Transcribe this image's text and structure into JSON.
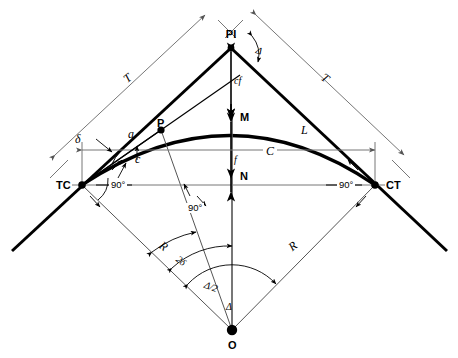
{
  "figure": {
    "type": "horizontal-circular-curve-geometry-diagram",
    "background_color": "#ffffff",
    "line_color": "#000000",
    "thin_line_color": "#7a7a7a"
  },
  "points": [
    {
      "id": "PI",
      "label": "PI",
      "x": 231,
      "y": 40,
      "style": "sans-b",
      "desc": "point-of-intersection"
    },
    {
      "id": "TC",
      "label": "TC",
      "x": 56,
      "y": 180,
      "style": "sans-b",
      "desc": "tangent-to-curve"
    },
    {
      "id": "CT",
      "label": "CT",
      "x": 386,
      "y": 180,
      "style": "sans-b",
      "desc": "curve-to-tangent"
    },
    {
      "id": "P",
      "label": "P",
      "x": 157,
      "y": 118,
      "style": "sans-b",
      "desc": "point-on-curve"
    },
    {
      "id": "O",
      "label": "O",
      "x": 228,
      "y": 340,
      "style": "sans-b",
      "desc": "center-of-curve"
    },
    {
      "id": "M",
      "label": "M",
      "x": 240,
      "y": 112,
      "style": "sans-b",
      "desc": "middle-ordinate-point"
    },
    {
      "id": "N",
      "label": "N",
      "x": 240,
      "y": 171,
      "style": "sans-b",
      "desc": "chord-midpoint-marker"
    }
  ],
  "dimensions": [
    {
      "id": "T-left",
      "label": "T",
      "x": 124,
      "y": 72,
      "style": "serif-i",
      "rot": -38,
      "desc": "tangent-distance-left"
    },
    {
      "id": "T-right",
      "label": "T",
      "x": 322,
      "y": 72,
      "style": "serif-i",
      "rot": 38,
      "desc": "tangent-distance-right"
    },
    {
      "id": "cf",
      "label": "cf",
      "x": 234,
      "y": 76,
      "style": "serif-i-s",
      "rot": 0,
      "desc": "external-distance"
    },
    {
      "id": "L",
      "label": "L",
      "x": 301,
      "y": 124,
      "style": "serif-i",
      "rot": 0,
      "desc": "length-of-curve"
    },
    {
      "id": "C",
      "label": "C",
      "x": 263,
      "y": 145,
      "style": "serif-i",
      "rot": 0,
      "desc": "long-chord"
    },
    {
      "id": "f",
      "label": "f",
      "x": 234,
      "y": 155,
      "style": "serif-i-s",
      "rot": 0,
      "desc": "middle-ordinate"
    },
    {
      "id": "a",
      "label": "a",
      "x": 128,
      "y": 128,
      "style": "serif-i",
      "rot": 0,
      "desc": "arc-length-partial"
    },
    {
      "id": "c",
      "label": "c",
      "x": 135,
      "y": 153,
      "style": "serif-i",
      "rot": 0,
      "desc": "chord-partial"
    },
    {
      "id": "delta",
      "label": "δ",
      "x": 75,
      "y": 133,
      "style": "serif-i",
      "rot": 0,
      "desc": "deflection-angle"
    },
    {
      "id": "R-left",
      "label": "R",
      "x": 160,
      "y": 240,
      "style": "serif-i",
      "rot": 38,
      "desc": "radius-left"
    },
    {
      "id": "R-right",
      "label": "R",
      "x": 289,
      "y": 240,
      "style": "serif-i",
      "rot": -38,
      "desc": "radius-right"
    },
    {
      "id": "twodelta",
      "label": "2δ",
      "x": 176,
      "y": 256,
      "style": "serif-i-s",
      "rot": 38,
      "desc": "two-delta-angle"
    },
    {
      "id": "delta-half",
      "label": "Δ/2",
      "x": 204,
      "y": 282,
      "style": "serif-i-s",
      "rot": 20,
      "desc": "half-central-angle"
    },
    {
      "id": "Delta-O",
      "label": "Δ",
      "x": 226,
      "y": 302,
      "style": "serif-i-s",
      "rot": 0,
      "desc": "central-angle-at-center"
    },
    {
      "id": "Delta-PI",
      "label": "Δ",
      "x": 256,
      "y": 46,
      "style": "serif-i-s",
      "rot": 20,
      "desc": "intersection-angle-at-PI"
    }
  ],
  "angle_marks": [
    {
      "id": "ninety-left",
      "label": "90°",
      "x": 109,
      "y": 180,
      "desc": "right-angle-at-TC"
    },
    {
      "id": "ninety-right",
      "label": "90°",
      "x": 337,
      "y": 180,
      "desc": "right-angle-at-CT"
    },
    {
      "id": "ninety-mid",
      "label": "90°",
      "x": 186,
      "y": 203,
      "desc": "right-angle-at-P-radius"
    }
  ]
}
